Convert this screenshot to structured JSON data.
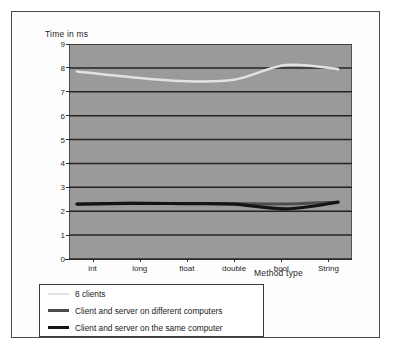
{
  "chart_data": {
    "type": "line",
    "title": "",
    "xlabel": "Method type",
    "ylabel": "Time in ms",
    "categories": [
      "int",
      "long",
      "float",
      "double",
      "bool",
      "String"
    ],
    "ylim": [
      0,
      9
    ],
    "yticks": [
      "0",
      "1",
      "2",
      "3",
      "4",
      "5",
      "6",
      "7",
      "8",
      "9"
    ],
    "grid": true,
    "legend_position": "bottom-left",
    "background": "#9a9a9a",
    "series": [
      {
        "name": "8 clients",
        "color": "#e2e2e2",
        "values": [
          7.85,
          7.62,
          7.45,
          7.5,
          8.12,
          7.95
        ]
      },
      {
        "name": "Client and server on different computers",
        "color": "#4d4d4d",
        "values": [
          2.3,
          2.33,
          2.32,
          2.32,
          2.3,
          2.38
        ]
      },
      {
        "name": "Client and server on the same computer",
        "color": "#141414",
        "values": [
          2.3,
          2.33,
          2.32,
          2.3,
          2.1,
          2.38
        ]
      }
    ]
  },
  "legend": {
    "items": [
      {
        "label": "8 clients",
        "color": "#e2e2e2",
        "thickness": 2.4
      },
      {
        "label": "Client and server on different computers",
        "color": "#4d4d4d",
        "thickness": 3.2
      },
      {
        "label": "Client and server on the same computer",
        "color": "#141414",
        "thickness": 3.4
      }
    ]
  },
  "axes": {
    "y_title": "Time in ms",
    "x_title": "Method type"
  }
}
